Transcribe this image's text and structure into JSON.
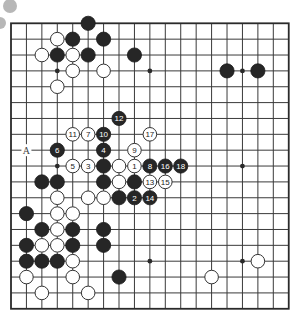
{
  "diagram": {
    "type": "go-board",
    "size": 19,
    "geometry": {
      "left": 11,
      "top": 23.3,
      "dx": 15.43,
      "dy": 15.86,
      "stone_radius": 7.1
    },
    "colors": {
      "line": "#3a3a3a",
      "black": "#262626",
      "white": "#ffffff",
      "deco": "#b7b7b7"
    },
    "decorations": [
      {
        "name": "gray-dot-top",
        "cx": 10,
        "cy": 6,
        "r": 7
      },
      {
        "name": "gray-dot-side",
        "cx": 0,
        "cy": 23,
        "r": 6
      }
    ],
    "star_points": [
      [
        3,
        3
      ],
      [
        9,
        3
      ],
      [
        15,
        3
      ],
      [
        3,
        9
      ],
      [
        9,
        9
      ],
      [
        15,
        9
      ],
      [
        3,
        15
      ],
      [
        9,
        15
      ],
      [
        15,
        15
      ]
    ],
    "black_stones": [
      [
        5,
        0
      ],
      [
        4,
        1
      ],
      [
        6,
        1
      ],
      [
        3,
        2
      ],
      [
        5,
        2
      ],
      [
        8,
        2
      ],
      [
        14,
        3
      ],
      [
        16,
        3
      ],
      [
        6,
        9
      ],
      [
        2,
        10
      ],
      [
        3,
        10
      ],
      [
        6,
        10
      ],
      [
        8,
        10
      ],
      [
        7,
        11
      ],
      [
        1,
        12
      ],
      [
        2,
        13
      ],
      [
        4,
        13
      ],
      [
        6,
        13
      ],
      [
        1,
        14
      ],
      [
        4,
        14
      ],
      [
        6,
        14
      ],
      [
        1,
        15
      ],
      [
        2,
        15
      ],
      [
        3,
        15
      ],
      [
        7,
        16
      ]
    ],
    "white_stones": [
      [
        3,
        1
      ],
      [
        2,
        2
      ],
      [
        4,
        2
      ],
      [
        4,
        3
      ],
      [
        6,
        3
      ],
      [
        3,
        4
      ],
      [
        7,
        9
      ],
      [
        7,
        10
      ],
      [
        3,
        11
      ],
      [
        5,
        11
      ],
      [
        6,
        11
      ],
      [
        3,
        12
      ],
      [
        4,
        12
      ],
      [
        3,
        13
      ],
      [
        2,
        14
      ],
      [
        3,
        14
      ],
      [
        4,
        15
      ],
      [
        1,
        16
      ],
      [
        4,
        16
      ],
      [
        13,
        16
      ],
      [
        16,
        15
      ],
      [
        2,
        17
      ],
      [
        5,
        17
      ]
    ],
    "numbered_moves": [
      {
        "n": "1",
        "color": "white",
        "col": 8,
        "row": 9
      },
      {
        "n": "2",
        "color": "black",
        "col": 8,
        "row": 11
      },
      {
        "n": "3",
        "color": "white",
        "col": 5,
        "row": 9
      },
      {
        "n": "4",
        "color": "black",
        "col": 6,
        "row": 8
      },
      {
        "n": "5",
        "color": "white",
        "col": 4,
        "row": 9
      },
      {
        "n": "6",
        "color": "black",
        "col": 3,
        "row": 8
      },
      {
        "n": "7",
        "color": "white",
        "col": 5,
        "row": 7
      },
      {
        "n": "8",
        "color": "black",
        "col": 9,
        "row": 9
      },
      {
        "n": "9",
        "color": "white",
        "col": 8,
        "row": 8
      },
      {
        "n": "10",
        "color": "black",
        "col": 6,
        "row": 7
      },
      {
        "n": "11",
        "color": "white",
        "col": 4,
        "row": 7
      },
      {
        "n": "12",
        "color": "black",
        "col": 7,
        "row": 6
      },
      {
        "n": "13",
        "color": "white",
        "col": 9,
        "row": 10
      },
      {
        "n": "14",
        "color": "black",
        "col": 9,
        "row": 11
      },
      {
        "n": "15",
        "color": "white",
        "col": 10,
        "row": 10
      },
      {
        "n": "16",
        "color": "black",
        "col": 10,
        "row": 9
      },
      {
        "n": "17",
        "color": "white",
        "col": 9,
        "row": 7
      },
      {
        "n": "18",
        "color": "black",
        "col": 11,
        "row": 9
      }
    ],
    "point_labels": [
      {
        "text": "A",
        "col": 1,
        "row": 8
      }
    ]
  }
}
